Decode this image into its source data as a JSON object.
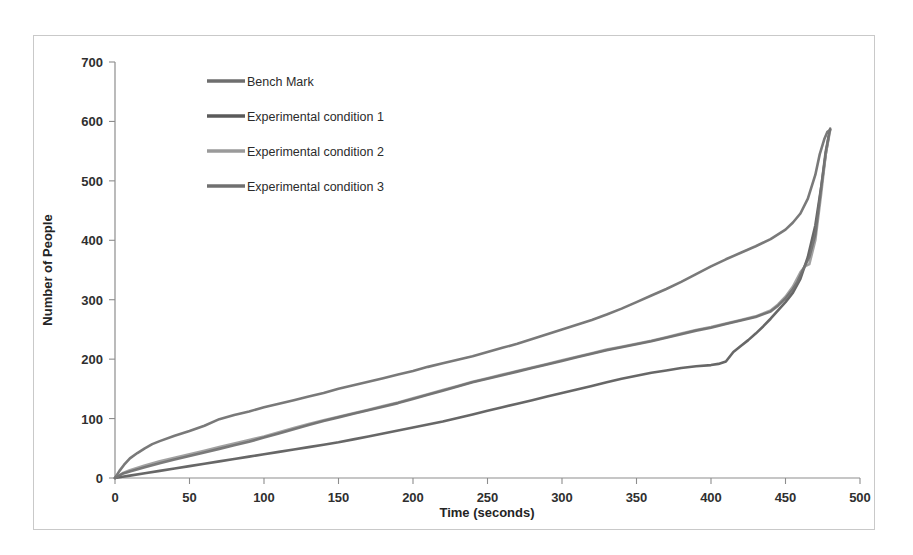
{
  "figure": {
    "frame_border_color": "#c9c9c9",
    "background_color": "#ffffff"
  },
  "chart_data": {
    "type": "line",
    "title": "",
    "xlabel": "Time (seconds)",
    "ylabel": "Number of People",
    "xlim": [
      0,
      500
    ],
    "ylim": [
      0,
      700
    ],
    "xticks": [
      0,
      50,
      100,
      150,
      200,
      250,
      300,
      350,
      400,
      450,
      500
    ],
    "yticks": [
      0,
      100,
      200,
      300,
      400,
      500,
      600,
      700
    ],
    "xtick_labels": [
      "0",
      "50",
      "100",
      "150",
      "200",
      "250",
      "300",
      "350",
      "400",
      "450",
      "500"
    ],
    "ytick_labels": [
      "0",
      "100",
      "200",
      "300",
      "400",
      "500",
      "600",
      "700"
    ],
    "grid": false,
    "legend_position": "upper-left-inside",
    "series": [
      {
        "name": "Bench Mark",
        "color": "#6e6e6e",
        "x": [
          0,
          3,
          6,
          10,
          15,
          20,
          25,
          30,
          40,
          50,
          60,
          70,
          80,
          90,
          100,
          110,
          120,
          130,
          140,
          150,
          160,
          170,
          180,
          190,
          200,
          210,
          220,
          230,
          240,
          250,
          260,
          270,
          280,
          290,
          300,
          310,
          320,
          330,
          340,
          350,
          360,
          370,
          380,
          390,
          400,
          410,
          420,
          430,
          440,
          450,
          455,
          460,
          465,
          470,
          473,
          476,
          478,
          480
        ],
        "y": [
          0,
          12,
          22,
          33,
          42,
          50,
          57,
          62,
          71,
          79,
          88,
          99,
          106,
          112,
          119,
          125,
          131,
          137,
          143,
          150,
          156,
          162,
          168,
          174,
          180,
          187,
          193,
          199,
          205,
          212,
          219,
          226,
          234,
          242,
          250,
          258,
          266,
          275,
          285,
          296,
          307,
          318,
          330,
          343,
          356,
          368,
          379,
          390,
          402,
          418,
          430,
          445,
          470,
          510,
          545,
          570,
          582,
          586
        ]
      },
      {
        "name": "Experimental condition 1",
        "color": "#5a5a5a",
        "x": [
          0,
          5,
          10,
          20,
          30,
          40,
          50,
          60,
          70,
          80,
          90,
          100,
          110,
          120,
          130,
          140,
          150,
          160,
          170,
          180,
          190,
          200,
          210,
          220,
          230,
          240,
          250,
          260,
          270,
          280,
          290,
          300,
          310,
          320,
          330,
          340,
          350,
          360,
          370,
          380,
          390,
          400,
          405,
          410,
          415,
          420,
          425,
          430,
          435,
          440,
          445,
          450,
          455,
          460,
          465,
          470,
          474,
          477,
          479
        ],
        "y": [
          0,
          2,
          4,
          8,
          12,
          16,
          20,
          24,
          28,
          32,
          36,
          40,
          44,
          48,
          52,
          56,
          60,
          65,
          70,
          75,
          80,
          85,
          90,
          95,
          101,
          107,
          113,
          119,
          125,
          131,
          137,
          143,
          149,
          155,
          161,
          167,
          172,
          177,
          181,
          185,
          188,
          190,
          192,
          196,
          212,
          222,
          232,
          243,
          255,
          268,
          282,
          296,
          312,
          335,
          372,
          425,
          490,
          545,
          575
        ]
      },
      {
        "name": "Experimental condition 2",
        "color": "#9a9a9a",
        "x": [
          0,
          5,
          10,
          20,
          30,
          40,
          50,
          60,
          70,
          80,
          90,
          100,
          110,
          120,
          130,
          140,
          150,
          160,
          170,
          180,
          190,
          200,
          210,
          220,
          230,
          240,
          250,
          260,
          270,
          280,
          290,
          300,
          310,
          320,
          330,
          340,
          350,
          360,
          370,
          380,
          390,
          400,
          410,
          420,
          430,
          440,
          445,
          450,
          455,
          460,
          463,
          466,
          470,
          474,
          477,
          480
        ],
        "y": [
          0,
          8,
          13,
          21,
          28,
          34,
          40,
          46,
          52,
          58,
          64,
          70,
          77,
          84,
          91,
          97,
          103,
          109,
          115,
          121,
          127,
          134,
          141,
          148,
          155,
          162,
          168,
          174,
          180,
          186,
          192,
          198,
          204,
          210,
          216,
          221,
          226,
          231,
          237,
          243,
          249,
          254,
          260,
          266,
          272,
          282,
          292,
          305,
          322,
          346,
          356,
          360,
          400,
          480,
          545,
          586
        ]
      },
      {
        "name": "Experimental condition 3",
        "color": "#707070",
        "x": [
          0,
          5,
          10,
          20,
          30,
          40,
          50,
          60,
          70,
          80,
          90,
          100,
          110,
          120,
          130,
          140,
          150,
          160,
          170,
          180,
          190,
          200,
          210,
          220,
          230,
          240,
          250,
          260,
          270,
          280,
          290,
          300,
          310,
          320,
          330,
          340,
          350,
          360,
          370,
          380,
          390,
          400,
          410,
          420,
          430,
          440,
          445,
          450,
          455,
          458,
          462,
          466,
          470,
          474,
          477,
          480
        ],
        "y": [
          0,
          7,
          11,
          18,
          25,
          31,
          37,
          43,
          49,
          55,
          61,
          68,
          75,
          82,
          89,
          96,
          102,
          108,
          114,
          120,
          126,
          133,
          140,
          147,
          154,
          161,
          167,
          173,
          179,
          185,
          191,
          197,
          203,
          209,
          215,
          220,
          225,
          230,
          236,
          242,
          248,
          253,
          259,
          265,
          271,
          280,
          290,
          302,
          318,
          330,
          352,
          372,
          410,
          490,
          550,
          588
        ]
      }
    ]
  },
  "legend": {
    "entries": [
      {
        "label": "Bench Mark",
        "color": "#6e6e6e"
      },
      {
        "label": "Experimental condition 1",
        "color": "#5a5a5a"
      },
      {
        "label": "Experimental condition 2",
        "color": "#9a9a9a"
      },
      {
        "label": "Experimental condition 3",
        "color": "#707070"
      }
    ]
  }
}
